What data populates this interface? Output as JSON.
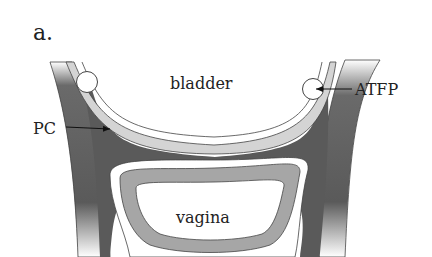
{
  "figure": {
    "panel_label": "a.",
    "labels": {
      "bladder": "bladder",
      "vagina": "vagina",
      "pc": "PC",
      "atfp": "ATFP"
    },
    "colors": {
      "background": "#ffffff",
      "muscle_dark": "#5a5a5a",
      "bladder_wall": "#d4d4d4",
      "vaginal_wall": "#a6a6a6",
      "outline": "#444444",
      "text": "#222222"
    }
  }
}
